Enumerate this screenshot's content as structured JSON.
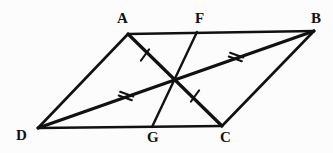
{
  "figure": {
    "kind": "geometry-diagram",
    "background_color": "#fcfcfc",
    "stroke_color": "#111111",
    "width": 333,
    "height": 153,
    "points": [
      {
        "id": "A",
        "label": "A",
        "x": 128,
        "y": 34,
        "label_x": 117,
        "label_y": 11,
        "type": "vertex"
      },
      {
        "id": "F",
        "label": "F",
        "x": 197,
        "y": 32,
        "label_x": 195,
        "label_y": 11,
        "type": "point-on-edge"
      },
      {
        "id": "B",
        "label": "B",
        "x": 314,
        "y": 31,
        "label_x": 311,
        "label_y": 11,
        "type": "vertex"
      },
      {
        "id": "D",
        "label": "D",
        "x": 38,
        "y": 128,
        "label_x": 16,
        "label_y": 128,
        "type": "vertex"
      },
      {
        "id": "G",
        "label": "G",
        "x": 152,
        "y": 127,
        "label_x": 147,
        "label_y": 130,
        "type": "point-on-edge"
      },
      {
        "id": "C",
        "label": "C",
        "x": 222,
        "y": 126,
        "label_x": 220,
        "label_y": 130,
        "type": "vertex"
      },
      {
        "id": "O",
        "label": "",
        "x": 175,
        "y": 80,
        "label_x": 0,
        "label_y": 0,
        "type": "intersection"
      }
    ],
    "edges": [
      {
        "id": "AB",
        "name": "edge-ab",
        "from": "A",
        "to": "B"
      },
      {
        "id": "BC",
        "name": "edge-bc",
        "from": "B",
        "to": "C"
      },
      {
        "id": "CD",
        "name": "edge-cd",
        "from": "C",
        "to": "D"
      },
      {
        "id": "DA",
        "name": "edge-da",
        "from": "D",
        "to": "A"
      }
    ],
    "diagonals": [
      {
        "id": "AC",
        "name": "diagonal-ac",
        "from": "A",
        "to": "C"
      },
      {
        "id": "DB",
        "name": "diagonal-db",
        "from": "D",
        "to": "B"
      }
    ],
    "cevians": [
      {
        "id": "FG",
        "name": "segment-fg",
        "from": "F",
        "to": "G"
      }
    ],
    "tick_marks": [
      {
        "id": "t1",
        "name": "tick-single-ao",
        "segment": "A-O",
        "count": 1,
        "x": 145,
        "y": 55,
        "angle": 36
      },
      {
        "id": "t2",
        "name": "tick-single-oc",
        "segment": "O-C",
        "count": 1,
        "x": 195,
        "y": 96,
        "angle": 36
      },
      {
        "id": "t3",
        "name": "tick-double-do",
        "segment": "D-O",
        "count": 2,
        "x": 126,
        "y": 96,
        "angle": 110
      },
      {
        "id": "t4",
        "name": "tick-double-ob",
        "segment": "O-B",
        "count": 2,
        "x": 236,
        "y": 57,
        "angle": 110
      }
    ]
  }
}
